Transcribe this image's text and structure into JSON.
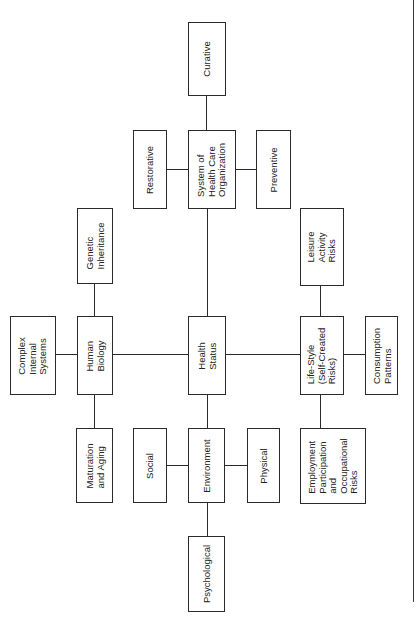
{
  "diagram": {
    "type": "tree",
    "orientation": "rotated-90-ccw",
    "root": "Health Status",
    "nodes": {
      "curative": "Curative",
      "restorative": "Restorative",
      "system_of_health_care": "System of\nHealth Care\nOrganization",
      "preventive": "Preventive",
      "genetic_inheritance": "Genetic\nInheritance",
      "leisure_activity_risks": "Leisure\nActivity\nRisks",
      "complex_internal_systems": "Complex\nInternal\nSystems",
      "human_biology": "Human\nBiology",
      "health_status": "Health\nStatus",
      "life_style": "Life-Style\n(Self-Created\nRisks)",
      "consumption_patterns": "Consumption\nPatterns",
      "maturation_and_aging": "Maturation\nand Aging",
      "social": "Social",
      "environment": "Environment",
      "physical": "Physical",
      "employment": "Employment\nParticipation\nand\nOccupational\nRisks",
      "psychological": "Psychological"
    },
    "edges": [
      [
        "Health Status",
        "System of Health Care Organization"
      ],
      [
        "Health Status",
        "Human Biology"
      ],
      [
        "Health Status",
        "Life-Style (Self-Created Risks)"
      ],
      [
        "Health Status",
        "Environment"
      ],
      [
        "System of Health Care Organization",
        "Curative"
      ],
      [
        "System of Health Care Organization",
        "Restorative"
      ],
      [
        "System of Health Care Organization",
        "Preventive"
      ],
      [
        "Human Biology",
        "Genetic Inheritance"
      ],
      [
        "Human Biology",
        "Complex Internal Systems"
      ],
      [
        "Human Biology",
        "Maturation and Aging"
      ],
      [
        "Life-Style (Self-Created Risks)",
        "Leisure Activity Risks"
      ],
      [
        "Life-Style (Self-Created Risks)",
        "Consumption Patterns"
      ],
      [
        "Life-Style (Self-Created Risks)",
        "Employment Participation and Occupational Risks"
      ],
      [
        "Environment",
        "Social"
      ],
      [
        "Environment",
        "Physical"
      ],
      [
        "Environment",
        "Psychological"
      ]
    ]
  }
}
